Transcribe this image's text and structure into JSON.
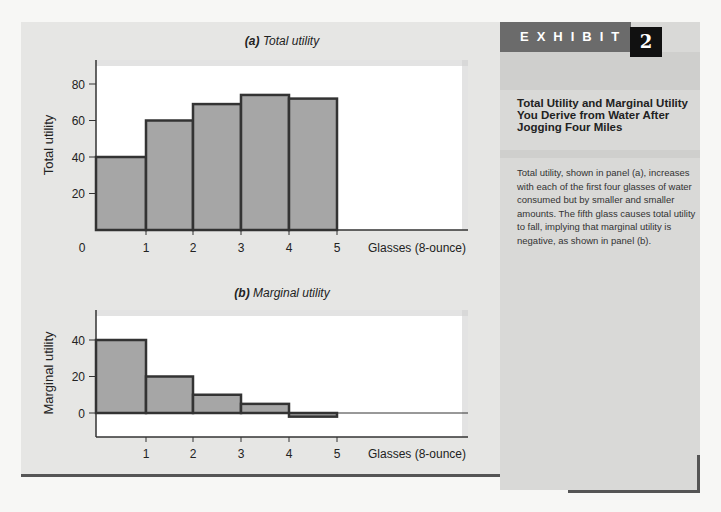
{
  "exhibit": {
    "label": "EXHIBIT",
    "number": "2",
    "title": "Total Utility and Marginal Utility You Derive from Water After Jogging Four Miles",
    "caption": "Total utility, shown in panel (a), increases with each of the first four glasses of water consumed but by smaller and smaller amounts. The fifth glass causes total utility to fall, implying that marginal utility is negative, as shown in panel (b)."
  },
  "panel_a": {
    "letter": "(a)",
    "title": "Total utility"
  },
  "panel_b": {
    "letter": "(b)",
    "title": "Marginal utility"
  },
  "colors": {
    "bar_fill": "#a6a6a6",
    "bar_stroke": "#333333",
    "plot_bg": "#ffffff",
    "panel_bg": "#e6e6e4",
    "sidebar_bg": "#d9d9d7"
  },
  "chart_data": [
    {
      "type": "bar",
      "title": "(a) Total utility",
      "xlabel": "Glasses (8-ounce)",
      "ylabel": "Total utility",
      "categories": [
        "1",
        "2",
        "3",
        "4",
        "5"
      ],
      "x_ticks": [
        "0",
        "1",
        "2",
        "3",
        "4",
        "5"
      ],
      "y_ticks": [
        20,
        40,
        60,
        80
      ],
      "values": [
        40,
        60,
        69,
        74,
        72
      ],
      "ylim": [
        0,
        95
      ],
      "grid": false
    },
    {
      "type": "bar",
      "title": "(b) Marginal utility",
      "xlabel": "Glasses (8-ounce)",
      "ylabel": "Marginal utility",
      "categories": [
        "1",
        "2",
        "3",
        "4",
        "5"
      ],
      "x_ticks": [
        "1",
        "2",
        "3",
        "4",
        "5"
      ],
      "y_ticks": [
        0,
        20,
        40
      ],
      "values": [
        40,
        20,
        10,
        5,
        -2
      ],
      "ylim": [
        -13,
        56
      ],
      "grid": false
    }
  ]
}
